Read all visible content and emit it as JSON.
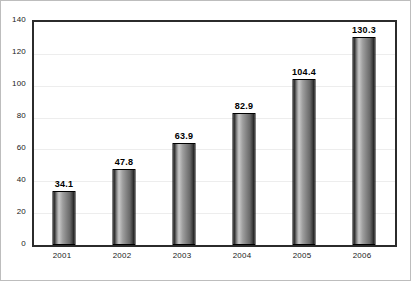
{
  "chart_data": {
    "type": "bar",
    "title": "",
    "subtitle": "",
    "xlabel": "",
    "ylabel": "",
    "categories": [
      "2001",
      "2002",
      "2003",
      "2004",
      "2005",
      "2006"
    ],
    "values": [
      34.1,
      47.8,
      63.9,
      82.9,
      104.4,
      130.3
    ],
    "data_labels": [
      "34.1",
      "47.8",
      "63.9",
      "82.9",
      "104.4",
      "130.3"
    ],
    "ylim": [
      0,
      140
    ],
    "ytick_labels": [
      "140",
      "120",
      "100",
      "80",
      "60",
      "40",
      "20",
      "0"
    ],
    "ytick_values": [
      140,
      120,
      100,
      80,
      60,
      40,
      20,
      0
    ],
    "grid": true,
    "legend": "none",
    "colors": {
      "bar_dark": "#1e1e1e",
      "bar_highlight": "#c9c9c9",
      "bar_mid": "#8e8e8e",
      "bar_outline": "#000000",
      "plot_border": "#2b2b2b",
      "gridline": "#ededed",
      "background": "#ffffff",
      "text": "#1a1a1a"
    }
  }
}
